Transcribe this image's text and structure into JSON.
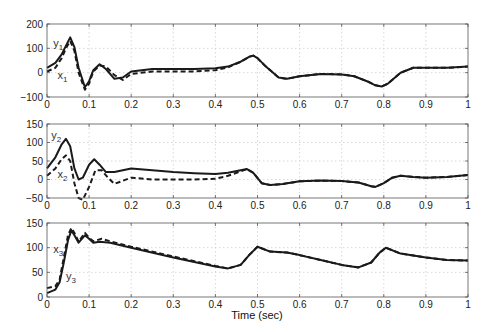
{
  "chart_data": [
    {
      "type": "line",
      "panel": "top",
      "title": "",
      "xlabel": "",
      "ylabel": "",
      "xlim": [
        0,
        1
      ],
      "ylim": [
        -100,
        200
      ],
      "xticks": [
        0,
        0.1,
        0.2,
        0.3,
        0.4,
        0.5,
        0.6,
        0.7,
        0.8,
        0.9,
        1
      ],
      "xtick_labels": [
        "0",
        "0.1",
        "0.2",
        "0.3",
        "0.4",
        "0.5",
        "0.6",
        "0.7",
        "0.8",
        "0.9",
        "1"
      ],
      "yticks": [
        -100,
        0,
        100,
        200
      ],
      "ytick_labels": [
        "-100",
        "0",
        "100",
        "200"
      ],
      "grid": true,
      "annotations": [
        {
          "text": "y",
          "sub": "1",
          "x": 0.015,
          "y": 105,
          "series": "y1"
        },
        {
          "text": "x",
          "sub": "1",
          "x": 0.025,
          "y": -25,
          "series": "x1"
        }
      ],
      "series": [
        {
          "name": "y1",
          "style": "solid",
          "x": [
            0,
            0.02,
            0.035,
            0.045,
            0.055,
            0.065,
            0.075,
            0.09,
            0.1,
            0.11,
            0.125,
            0.14,
            0.16,
            0.18,
            0.2,
            0.25,
            0.3,
            0.35,
            0.4,
            0.43,
            0.46,
            0.48,
            0.49,
            0.5,
            0.52,
            0.55,
            0.57,
            0.6,
            0.65,
            0.7,
            0.73,
            0.76,
            0.78,
            0.795,
            0.81,
            0.84,
            0.87,
            0.9,
            0.95,
            1
          ],
          "values": [
            20,
            40,
            75,
            110,
            145,
            105,
            20,
            -60,
            -35,
            10,
            35,
            15,
            -25,
            -20,
            5,
            15,
            15,
            15,
            18,
            25,
            45,
            65,
            70,
            60,
            25,
            -20,
            -25,
            -15,
            -5,
            -7,
            -15,
            -35,
            -52,
            -57,
            -45,
            0,
            20,
            20,
            20,
            25
          ]
        },
        {
          "name": "x1",
          "style": "dashed",
          "x": [
            0,
            0.02,
            0.035,
            0.045,
            0.055,
            0.065,
            0.075,
            0.09,
            0.1,
            0.11,
            0.125,
            0.14,
            0.16,
            0.18,
            0.2,
            0.25,
            0.3,
            0.35,
            0.4,
            0.43,
            0.46,
            0.48,
            0.49,
            0.5,
            0.52,
            0.55,
            0.57,
            0.6,
            0.65,
            0.7,
            0.73,
            0.76,
            0.78,
            0.795,
            0.81,
            0.84,
            0.87,
            0.9,
            0.95,
            1
          ],
          "values": [
            5,
            20,
            60,
            100,
            130,
            90,
            0,
            -70,
            -45,
            5,
            30,
            25,
            -10,
            -30,
            -5,
            5,
            5,
            5,
            10,
            22,
            45,
            65,
            70,
            60,
            25,
            -20,
            -25,
            -15,
            -5,
            -7,
            -15,
            -35,
            -52,
            -57,
            -45,
            0,
            20,
            20,
            20,
            25
          ]
        }
      ]
    },
    {
      "type": "line",
      "panel": "middle",
      "title": "",
      "xlabel": "",
      "ylabel": "",
      "xlim": [
        0,
        1
      ],
      "ylim": [
        -50,
        150
      ],
      "xticks": [
        0,
        0.1,
        0.2,
        0.3,
        0.4,
        0.5,
        0.6,
        0.7,
        0.8,
        0.9,
        1
      ],
      "xtick_labels": [
        "0",
        "0.1",
        "0.2",
        "0.3",
        "0.4",
        "0.5",
        "0.6",
        "0.7",
        "0.8",
        "0.9",
        "1"
      ],
      "yticks": [
        -50,
        0,
        50,
        100,
        150
      ],
      "ytick_labels": [
        "-50",
        "0",
        "50",
        "100",
        "150"
      ],
      "grid": true,
      "annotations": [
        {
          "text": "y",
          "sub": "2",
          "x": 0.01,
          "y": 110,
          "series": "y2"
        },
        {
          "text": "x",
          "sub": "2",
          "x": 0.025,
          "y": 5,
          "series": "x2"
        }
      ],
      "series": [
        {
          "name": "y2",
          "style": "solid",
          "x": [
            0,
            0.02,
            0.035,
            0.045,
            0.055,
            0.065,
            0.075,
            0.085,
            0.1,
            0.112,
            0.125,
            0.14,
            0.16,
            0.2,
            0.25,
            0.3,
            0.35,
            0.4,
            0.43,
            0.46,
            0.475,
            0.49,
            0.51,
            0.53,
            0.56,
            0.6,
            0.65,
            0.7,
            0.74,
            0.77,
            0.78,
            0.8,
            0.82,
            0.84,
            0.87,
            0.9,
            0.95,
            1
          ],
          "values": [
            30,
            60,
            95,
            110,
            90,
            30,
            0,
            5,
            40,
            55,
            40,
            20,
            20,
            30,
            25,
            20,
            17,
            15,
            18,
            25,
            28,
            18,
            -10,
            -15,
            -12,
            -5,
            -3,
            -4,
            -8,
            -18,
            -20,
            -10,
            5,
            10,
            7,
            5,
            7,
            12
          ]
        },
        {
          "name": "x2",
          "style": "dashed",
          "x": [
            0,
            0.02,
            0.035,
            0.045,
            0.055,
            0.065,
            0.075,
            0.085,
            0.1,
            0.115,
            0.13,
            0.145,
            0.16,
            0.2,
            0.25,
            0.3,
            0.35,
            0.4,
            0.43,
            0.46,
            0.475,
            0.49,
            0.51,
            0.53,
            0.56,
            0.6,
            0.65,
            0.7,
            0.74,
            0.77,
            0.78,
            0.8,
            0.82,
            0.84,
            0.87,
            0.9,
            0.95,
            1
          ],
          "values": [
            10,
            30,
            55,
            65,
            50,
            -10,
            -50,
            -55,
            -20,
            25,
            25,
            5,
            -12,
            5,
            0,
            0,
            0,
            2,
            10,
            22,
            28,
            18,
            -10,
            -15,
            -12,
            -5,
            -3,
            -4,
            -8,
            -18,
            -20,
            -10,
            5,
            10,
            7,
            5,
            7,
            12
          ]
        }
      ]
    },
    {
      "type": "line",
      "panel": "bottom",
      "title": "",
      "xlabel": "Time (sec)",
      "ylabel": "",
      "xlim": [
        0,
        1
      ],
      "ylim": [
        0,
        150
      ],
      "xticks": [
        0,
        0.1,
        0.2,
        0.3,
        0.4,
        0.5,
        0.6,
        0.7,
        0.8,
        0.9,
        1
      ],
      "xtick_labels": [
        "0",
        "0.1",
        "0.2",
        "0.3",
        "0.4",
        "0.5",
        "0.6",
        "0.7",
        "0.8",
        "0.9",
        "1"
      ],
      "yticks": [
        0,
        50,
        100,
        150
      ],
      "ytick_labels": [
        "0",
        "50",
        "100",
        "150"
      ],
      "grid": true,
      "annotations": [
        {
          "text": "x",
          "sub": "3",
          "x": 0.015,
          "y": 90,
          "series": "x3"
        },
        {
          "text": "y",
          "sub": "3",
          "x": 0.045,
          "y": 35,
          "series": "y3"
        }
      ],
      "series": [
        {
          "name": "y3",
          "style": "solid",
          "x": [
            0,
            0.02,
            0.03,
            0.04,
            0.05,
            0.058,
            0.065,
            0.075,
            0.09,
            0.1,
            0.11,
            0.125,
            0.15,
            0.2,
            0.3,
            0.4,
            0.43,
            0.46,
            0.48,
            0.5,
            0.53,
            0.57,
            0.6,
            0.65,
            0.7,
            0.74,
            0.77,
            0.79,
            0.805,
            0.84,
            0.9,
            0.95,
            1
          ],
          "values": [
            8,
            15,
            30,
            70,
            115,
            135,
            125,
            110,
            125,
            118,
            110,
            112,
            110,
            100,
            80,
            62,
            58,
            65,
            85,
            102,
            92,
            90,
            85,
            75,
            65,
            60,
            70,
            90,
            100,
            88,
            80,
            75,
            74
          ]
        },
        {
          "name": "x3",
          "style": "dashed",
          "x": [
            0,
            0.02,
            0.03,
            0.04,
            0.05,
            0.058,
            0.065,
            0.075,
            0.09,
            0.1,
            0.11,
            0.13,
            0.15,
            0.2,
            0.3,
            0.4,
            0.43,
            0.46,
            0.48,
            0.5,
            0.53,
            0.57,
            0.6,
            0.65,
            0.7,
            0.74,
            0.77,
            0.79,
            0.805,
            0.84,
            0.9,
            0.95,
            1
          ],
          "values": [
            18,
            22,
            35,
            80,
            125,
            140,
            130,
            112,
            130,
            120,
            113,
            118,
            113,
            102,
            82,
            63,
            58,
            65,
            85,
            102,
            92,
            90,
            85,
            75,
            65,
            60,
            70,
            90,
            100,
            88,
            80,
            75,
            74
          ]
        }
      ]
    }
  ],
  "figure": {
    "xlabel": "Time (sec)",
    "line_color": "#1a1a1a",
    "grid_color": "#c8c8c8",
    "axis_color": "#555555"
  }
}
